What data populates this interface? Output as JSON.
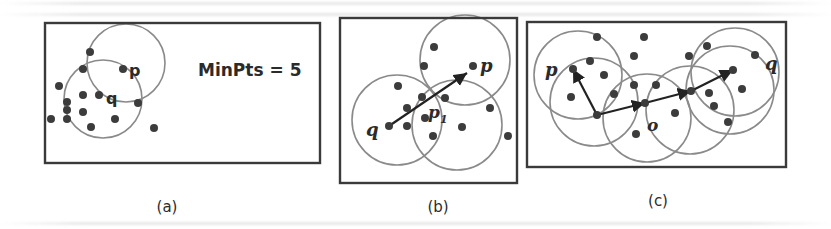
{
  "figure": {
    "colors": {
      "box_stroke": "#3a3a3a",
      "circle_stroke": "#8a8a8a",
      "point_fill": "#3c3c3c",
      "arrow_stroke": "#222222",
      "text": "#2b2b2b"
    },
    "panels": [
      {
        "id": "a",
        "label": "(a)",
        "label_pos": {
          "x": 167,
          "y": 198
        },
        "box": {
          "x": 45,
          "y": 23,
          "w": 275,
          "h": 140
        },
        "annotation": {
          "text": "MinPts = 5",
          "x": 198,
          "y": 76,
          "size": 17
        },
        "circles": [
          {
            "cx": 126,
            "cy": 63,
            "r": 39
          },
          {
            "cx": 103,
            "cy": 99,
            "r": 39
          }
        ],
        "points": [
          {
            "x": 90,
            "y": 52
          },
          {
            "x": 83,
            "y": 69
          },
          {
            "x": 123,
            "y": 69
          },
          {
            "x": 59,
            "y": 86
          },
          {
            "x": 83,
            "y": 95
          },
          {
            "x": 99,
            "y": 95
          },
          {
            "x": 67,
            "y": 102
          },
          {
            "x": 67,
            "y": 110
          },
          {
            "x": 83,
            "y": 112
          },
          {
            "x": 138,
            "y": 103
          },
          {
            "x": 51,
            "y": 119
          },
          {
            "x": 67,
            "y": 119
          },
          {
            "x": 115,
            "y": 119
          },
          {
            "x": 91,
            "y": 127
          },
          {
            "x": 154,
            "y": 128
          }
        ],
        "labels": [
          {
            "text": "p",
            "x": 129,
            "y": 76,
            "italic": false,
            "size": 16
          },
          {
            "text": "q",
            "x": 106,
            "y": 104,
            "italic": false,
            "size": 16
          }
        ],
        "arrows": []
      },
      {
        "id": "b",
        "label": "(b)",
        "label_pos": {
          "x": 438,
          "y": 198
        },
        "box": {
          "x": 340,
          "y": 18,
          "w": 177,
          "h": 165
        },
        "annotation": null,
        "circles": [
          {
            "cx": 465,
            "cy": 60,
            "r": 45
          },
          {
            "cx": 397,
            "cy": 120,
            "r": 45
          },
          {
            "cx": 457,
            "cy": 125,
            "r": 45
          }
        ],
        "points": [
          {
            "x": 434,
            "y": 47
          },
          {
            "x": 424,
            "y": 66
          },
          {
            "x": 473,
            "y": 66
          },
          {
            "x": 398,
            "y": 86
          },
          {
            "x": 422,
            "y": 97
          },
          {
            "x": 445,
            "y": 98
          },
          {
            "x": 407,
            "y": 108
          },
          {
            "x": 425,
            "y": 118
          },
          {
            "x": 490,
            "y": 108
          },
          {
            "x": 389,
            "y": 126
          },
          {
            "x": 407,
            "y": 126
          },
          {
            "x": 462,
            "y": 127
          },
          {
            "x": 433,
            "y": 136
          },
          {
            "x": 508,
            "y": 136
          }
        ],
        "labels": [
          {
            "text": "p",
            "x": 480,
            "y": 72,
            "italic": true,
            "size": 18
          },
          {
            "text": "q",
            "x": 366,
            "y": 136,
            "italic": true,
            "size": 18
          },
          {
            "text": "p",
            "x": 428,
            "y": 118,
            "italic": true,
            "size": 17
          },
          {
            "text": "1",
            "x": 440,
            "y": 123,
            "italic": true,
            "size": 11
          }
        ],
        "arrows": [
          {
            "x1": 389,
            "y1": 126,
            "x2": 467,
            "y2": 73
          }
        ]
      },
      {
        "id": "c",
        "label": "(c)",
        "label_pos": {
          "x": 658,
          "y": 192
        },
        "box": {
          "x": 527,
          "y": 22,
          "w": 259,
          "h": 145
        },
        "annotation": null,
        "circles": [
          {
            "cx": 578,
            "cy": 75,
            "r": 44
          },
          {
            "cx": 594,
            "cy": 102,
            "r": 44
          },
          {
            "cx": 647,
            "cy": 118,
            "r": 44
          },
          {
            "cx": 690,
            "cy": 110,
            "r": 44
          },
          {
            "cx": 730,
            "cy": 90,
            "r": 44
          },
          {
            "cx": 735,
            "cy": 72,
            "r": 44
          }
        ],
        "points": [
          {
            "x": 597,
            "y": 37
          },
          {
            "x": 644,
            "y": 37
          },
          {
            "x": 634,
            "y": 56
          },
          {
            "x": 590,
            "y": 61
          },
          {
            "x": 573,
            "y": 69
          },
          {
            "x": 604,
            "y": 75
          },
          {
            "x": 634,
            "y": 85
          },
          {
            "x": 656,
            "y": 85
          },
          {
            "x": 614,
            "y": 94
          },
          {
            "x": 571,
            "y": 97
          },
          {
            "x": 597,
            "y": 115
          },
          {
            "x": 645,
            "y": 103
          },
          {
            "x": 675,
            "y": 113
          },
          {
            "x": 636,
            "y": 134
          },
          {
            "x": 707,
            "y": 46
          },
          {
            "x": 689,
            "y": 56
          },
          {
            "x": 755,
            "y": 55
          },
          {
            "x": 733,
            "y": 70
          },
          {
            "x": 742,
            "y": 89
          },
          {
            "x": 691,
            "y": 91
          },
          {
            "x": 709,
            "y": 93
          },
          {
            "x": 714,
            "y": 106
          },
          {
            "x": 728,
            "y": 122
          }
        ],
        "labels": [
          {
            "text": "p",
            "x": 545,
            "y": 76,
            "italic": true,
            "size": 18
          },
          {
            "text": "q",
            "x": 765,
            "y": 70,
            "italic": true,
            "size": 18
          },
          {
            "text": "o",
            "x": 647,
            "y": 131,
            "italic": true,
            "size": 17
          }
        ],
        "arrows": [
          {
            "x1": 597,
            "y1": 115,
            "x2": 573,
            "y2": 69
          },
          {
            "x1": 597,
            "y1": 115,
            "x2": 645,
            "y2": 103
          },
          {
            "x1": 645,
            "y1": 103,
            "x2": 691,
            "y2": 91
          },
          {
            "x1": 691,
            "y1": 91,
            "x2": 733,
            "y2": 70
          }
        ]
      }
    ]
  }
}
